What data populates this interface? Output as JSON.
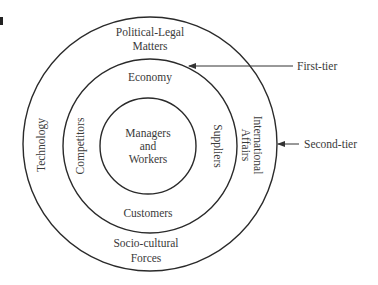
{
  "figure_fragment": "a",
  "rings": {
    "outer": {
      "name": "second-tier",
      "labels": {
        "top": [
          "Political-Legal",
          "Matters"
        ],
        "left": "Technology",
        "right": [
          "International",
          "Affairs"
        ],
        "bottom": [
          "Socio-cultural",
          "Forces"
        ]
      }
    },
    "middle": {
      "name": "first-tier",
      "labels": {
        "top": "Economy",
        "left": "Competitors",
        "right": "Suppliers",
        "bottom": "Customers"
      }
    },
    "inner": {
      "labels": [
        "Managers",
        "and",
        "Workers"
      ]
    }
  },
  "pointers": {
    "first_tier": "First-tier",
    "second_tier": "Second-tier"
  },
  "colors": {
    "line": "#2a2a2a",
    "text": "#3a3a3a"
  }
}
